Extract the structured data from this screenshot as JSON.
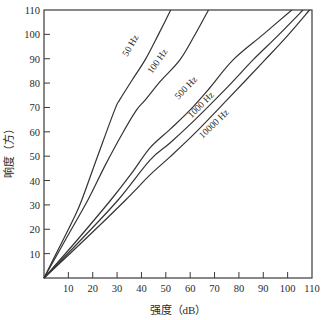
{
  "chart_data": {
    "type": "line",
    "title": "",
    "xlabel": "强度（dB）",
    "ylabel": "响度（方）",
    "xlim": [
      0,
      110
    ],
    "ylim": [
      0,
      110
    ],
    "x_ticks": [
      10,
      20,
      30,
      40,
      50,
      60,
      70,
      80,
      90,
      100,
      110
    ],
    "y_ticks": [
      10,
      20,
      30,
      40,
      50,
      60,
      70,
      80,
      90,
      100,
      110
    ],
    "grid": false,
    "legend": "inline labels on curves",
    "series": [
      {
        "name": "50 Hz",
        "points": [
          [
            0,
            0
          ],
          [
            6,
            12
          ],
          [
            12,
            24
          ],
          [
            15.5,
            32
          ],
          [
            22,
            50
          ],
          [
            29,
            69
          ],
          [
            31,
            73
          ],
          [
            36,
            81
          ],
          [
            41.5,
            89.5
          ],
          [
            47,
            100
          ],
          [
            52,
            110
          ]
        ],
        "label_pos": [
          133,
          47
        ],
        "label_rot": -60
      },
      {
        "name": "100 Hz",
        "points": [
          [
            0,
            0
          ],
          [
            9,
            16
          ],
          [
            18,
            32
          ],
          [
            25,
            46
          ],
          [
            32,
            59
          ],
          [
            38,
            69
          ],
          [
            41.5,
            73
          ],
          [
            48,
            81
          ],
          [
            55.8,
            89.5
          ],
          [
            61.5,
            99
          ],
          [
            67.5,
            110
          ]
        ],
        "label_pos": [
          160,
          63
        ],
        "label_rot": -55
      },
      {
        "name": "500 Hz",
        "points": [
          [
            0,
            0
          ],
          [
            14,
            16
          ],
          [
            27.4,
            32
          ],
          [
            36,
            43
          ],
          [
            43.5,
            53.4
          ],
          [
            51.7,
            61
          ],
          [
            60,
            69
          ],
          [
            68,
            78
          ],
          [
            77.6,
            89.5
          ],
          [
            90,
            100
          ],
          [
            101.7,
            110
          ]
        ],
        "label_pos": [
          188,
          90
        ],
        "label_rot": -46
      },
      {
        "name": "1000 Hz",
        "points": [
          [
            0,
            0
          ],
          [
            15.5,
            16
          ],
          [
            30.4,
            32
          ],
          [
            43.5,
            48.4
          ],
          [
            51.7,
            55.4
          ],
          [
            62,
            65
          ],
          [
            74,
            77
          ],
          [
            85.8,
            89.5
          ],
          [
            96,
            99.5
          ],
          [
            106.3,
            110
          ]
        ],
        "label_pos": [
          203,
          107
        ],
        "label_rot": -45
      },
      {
        "name": "10000 Hz",
        "points": [
          [
            0,
            0
          ],
          [
            17,
            16
          ],
          [
            33.5,
            32
          ],
          [
            43.5,
            42.3
          ],
          [
            51.7,
            49.7
          ],
          [
            63,
            60.5
          ],
          [
            76,
            74
          ],
          [
            90.7,
            89.5
          ],
          [
            100,
            99.5
          ],
          [
            109,
            110
          ]
        ],
        "label_pos": [
          216,
          126
        ],
        "label_rot": -44
      }
    ]
  },
  "layout": {
    "plot_left": 44,
    "plot_right": 312,
    "plot_top": 10,
    "plot_bottom": 278
  }
}
